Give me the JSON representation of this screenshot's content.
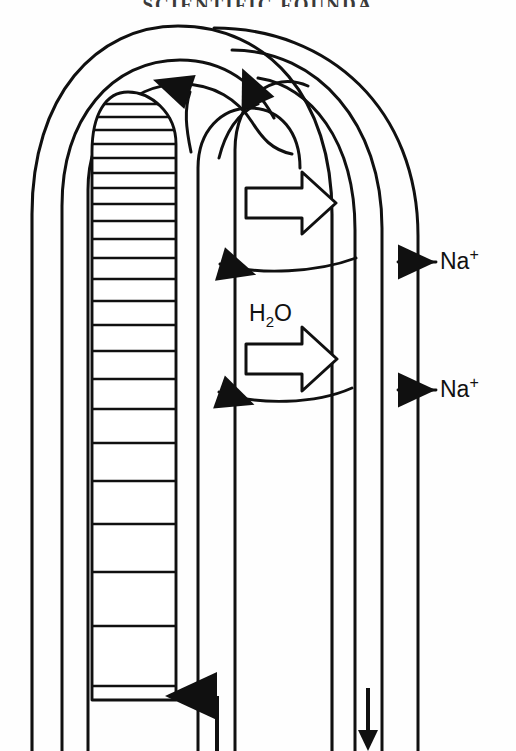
{
  "page": {
    "header_text": "SCIENTIFIC FOUNDA",
    "background": "#ffffff",
    "ink": "#101010",
    "width": 516,
    "height": 751
  },
  "labels": {
    "na_upper": {
      "text": "Na",
      "charge": "+",
      "name": "sodium-ion-upper"
    },
    "na_lower": {
      "text": "Na",
      "charge": "+",
      "name": "sodium-ion-lower"
    },
    "water": {
      "text": "H",
      "sub": "2",
      "tail": "O",
      "name": "water-molecule"
    }
  },
  "structures": {
    "outer_wall": "outermost arch outline",
    "interstitium": "second nested arch",
    "descending_limb": "inner arch with ladder hatching",
    "ascending_limb": "right vertical limb",
    "collecting_duct": "rightmost vertical pair"
  },
  "arrows": {
    "block_arrow_upper": {
      "direction": "right",
      "meaning": "water efflux upper",
      "name": "water-efflux-arrow-upper"
    },
    "block_arrow_lower": {
      "direction": "right",
      "meaning": "water efflux lower",
      "name": "water-efflux-arrow-lower"
    },
    "na_arrow_upper": {
      "direction": "left",
      "meaning": "sodium entry upper",
      "name": "sodium-inflow-arrow-upper"
    },
    "na_arrow_lower": {
      "direction": "left",
      "meaning": "sodium entry lower",
      "name": "sodium-inflow-arrow-lower"
    },
    "curved_arrow_left": {
      "direction": "up-left",
      "meaning": "flow turning at apex",
      "name": "apex-flow-arrow-left"
    },
    "curved_arrow_right": {
      "direction": "up-right",
      "meaning": "flow turning at apex",
      "name": "apex-flow-arrow-right"
    },
    "bottom_up": {
      "direction": "up",
      "meaning": "ascending flow inlet",
      "name": "ascending-flow-arrow"
    },
    "bottom_down": {
      "direction": "down",
      "meaning": "descending flow outlet",
      "name": "descending-flow-arrow"
    }
  }
}
